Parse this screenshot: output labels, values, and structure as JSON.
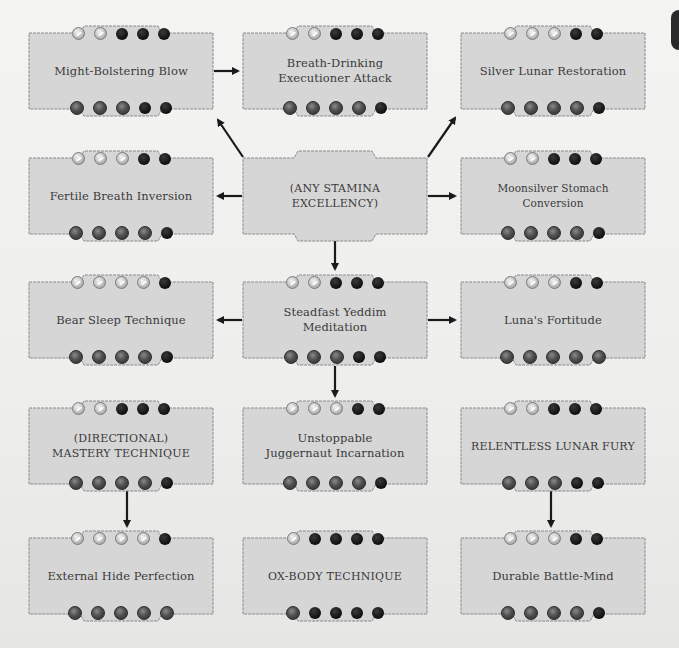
{
  "diagram": {
    "type": "charm-tree",
    "dot_legend": {
      "silver": "filled upper dot (silver)",
      "black": "empty/black dot",
      "dark": "filled lower dot (dark gray)"
    },
    "colors": {
      "background": "#f1f1f0",
      "box_fill": "#d6d6d6",
      "box_border": "#8a8a8a",
      "text": "#3a3a3a",
      "arrow": "#1a1a1a"
    }
  },
  "charms": [
    {
      "id": "might-bolstering-blow",
      "label": "Might-Bolstering Blow",
      "top": [
        "silver",
        "silver",
        "black",
        "black",
        "black"
      ],
      "bottom": [
        "dark",
        "dark",
        "dark",
        "black",
        "black"
      ]
    },
    {
      "id": "breath-drinking-executioner-attack",
      "label": "Breath-Drinking Executioner Attack",
      "top": [
        "silver",
        "silver",
        "black",
        "black",
        "black"
      ],
      "bottom": [
        "dark",
        "dark",
        "dark",
        "dark",
        "black"
      ]
    },
    {
      "id": "silver-lunar-restoration",
      "label": "Silver Lunar Restoration",
      "top": [
        "silver",
        "silver",
        "silver",
        "black",
        "black"
      ],
      "bottom": [
        "dark",
        "dark",
        "dark",
        "dark",
        "black"
      ]
    },
    {
      "id": "fertile-breath-inversion",
      "label": "Fertile Breath Inversion",
      "top": [
        "silver",
        "silver",
        "silver",
        "black",
        "black"
      ],
      "bottom": [
        "dark",
        "dark",
        "dark",
        "dark",
        "black"
      ]
    },
    {
      "id": "any-stamina-excellency",
      "label": "(ANY STAMINA EXCELLENCY)",
      "top": [],
      "bottom": []
    },
    {
      "id": "moonsilver-stomach-conversion",
      "label": "Moonsilver Stomach Conversion",
      "top": [
        "silver",
        "silver",
        "black",
        "black",
        "black"
      ],
      "bottom": [
        "dark",
        "dark",
        "dark",
        "dark",
        "black"
      ]
    },
    {
      "id": "bear-sleep-technique",
      "label": "Bear Sleep Technique",
      "top": [
        "silver",
        "silver",
        "silver",
        "silver",
        "black"
      ],
      "bottom": [
        "dark",
        "dark",
        "dark",
        "dark",
        "black"
      ]
    },
    {
      "id": "steadfast-yeddim-meditation",
      "label": "Steadfast Yeddim Meditation",
      "top": [
        "silver",
        "silver",
        "black",
        "black",
        "black"
      ],
      "bottom": [
        "dark",
        "dark",
        "dark",
        "black",
        "black"
      ]
    },
    {
      "id": "lunas-fortitude",
      "label": "Luna's Fortitude",
      "top": [
        "silver",
        "silver",
        "silver",
        "black",
        "black"
      ],
      "bottom": [
        "dark",
        "dark",
        "dark",
        "dark",
        "dark"
      ]
    },
    {
      "id": "directional-mastery-technique",
      "label": "(DIRECTIONAL) MASTERY TECHNIQUE",
      "label_lines": [
        "(DIRECTIONAL)",
        "MASTERY TECHNIQUE"
      ],
      "top": [
        "silver",
        "silver",
        "black",
        "black",
        "black"
      ],
      "bottom": [
        "dark",
        "dark",
        "dark",
        "dark",
        "black"
      ]
    },
    {
      "id": "unstoppable-juggernaut-incarnation",
      "label": "Unstoppable Juggernaut Incarnation",
      "label_lines": [
        "Unstoppable",
        "Juggernaut Incarnation"
      ],
      "top": [
        "silver",
        "silver",
        "silver",
        "black",
        "black"
      ],
      "bottom": [
        "dark",
        "dark",
        "dark",
        "dark",
        "black"
      ]
    },
    {
      "id": "relentless-lunar-fury",
      "label": "RELENTLESS LUNAR FURY",
      "top": [
        "silver",
        "silver",
        "black",
        "black",
        "black"
      ],
      "bottom": [
        "dark",
        "dark",
        "dark",
        "black",
        "black"
      ]
    },
    {
      "id": "external-hide-perfection",
      "label": "External Hide Perfection",
      "top": [
        "silver",
        "silver",
        "silver",
        "silver",
        "black"
      ],
      "bottom": [
        "dark",
        "dark",
        "dark",
        "dark",
        "dark"
      ]
    },
    {
      "id": "ox-body-technique",
      "label": "OX-BODY TECHNIQUE",
      "top": [
        "silver",
        "black",
        "black",
        "black",
        "black"
      ],
      "bottom": [
        "dark",
        "black",
        "black",
        "black",
        "black"
      ]
    },
    {
      "id": "durable-battle-mind",
      "label": "Durable Battle-Mind",
      "top": [
        "silver",
        "silver",
        "silver",
        "black",
        "black"
      ],
      "bottom": [
        "dark",
        "dark",
        "dark",
        "dark",
        "black"
      ]
    }
  ],
  "labels": {
    "c0": "Might-Bolstering Blow",
    "c1a": "Breath-Drinking",
    "c1b": "Executioner Attack",
    "c2": "Silver Lunar Restoration",
    "c3": "Fertile Breath Inversion",
    "c4": "(ANY STAMINA EXCELLENCY)",
    "c5": "Moonsilver Stomach Conversion",
    "c6": "Bear Sleep Technique",
    "c7": "Steadfast Yeddim Meditation",
    "c8": "Luna's Fortitude",
    "c9a": "(DIRECTIONAL)",
    "c9b": "MASTERY TECHNIQUE",
    "c10a": "Unstoppable",
    "c10b": "Juggernaut Incarnation",
    "c11": "RELENTLESS LUNAR FURY",
    "c12": "External Hide Perfection",
    "c13": "OX-BODY TECHNIQUE",
    "c14": "Durable Battle-Mind"
  },
  "connections": [
    {
      "from": "might-bolstering-blow",
      "to": "breath-drinking-executioner-attack"
    },
    {
      "from": "any-stamina-excellency",
      "to": "might-bolstering-blow"
    },
    {
      "from": "any-stamina-excellency",
      "to": "silver-lunar-restoration"
    },
    {
      "from": "any-stamina-excellency",
      "to": "fertile-breath-inversion"
    },
    {
      "from": "any-stamina-excellency",
      "to": "moonsilver-stomach-conversion"
    },
    {
      "from": "any-stamina-excellency",
      "to": "steadfast-yeddim-meditation"
    },
    {
      "from": "steadfast-yeddim-meditation",
      "to": "bear-sleep-technique"
    },
    {
      "from": "steadfast-yeddim-meditation",
      "to": "lunas-fortitude"
    },
    {
      "from": "steadfast-yeddim-meditation",
      "to": "unstoppable-juggernaut-incarnation"
    },
    {
      "from": "directional-mastery-technique",
      "to": "external-hide-perfection"
    },
    {
      "from": "relentless-lunar-fury",
      "to": "durable-battle-mind"
    }
  ]
}
